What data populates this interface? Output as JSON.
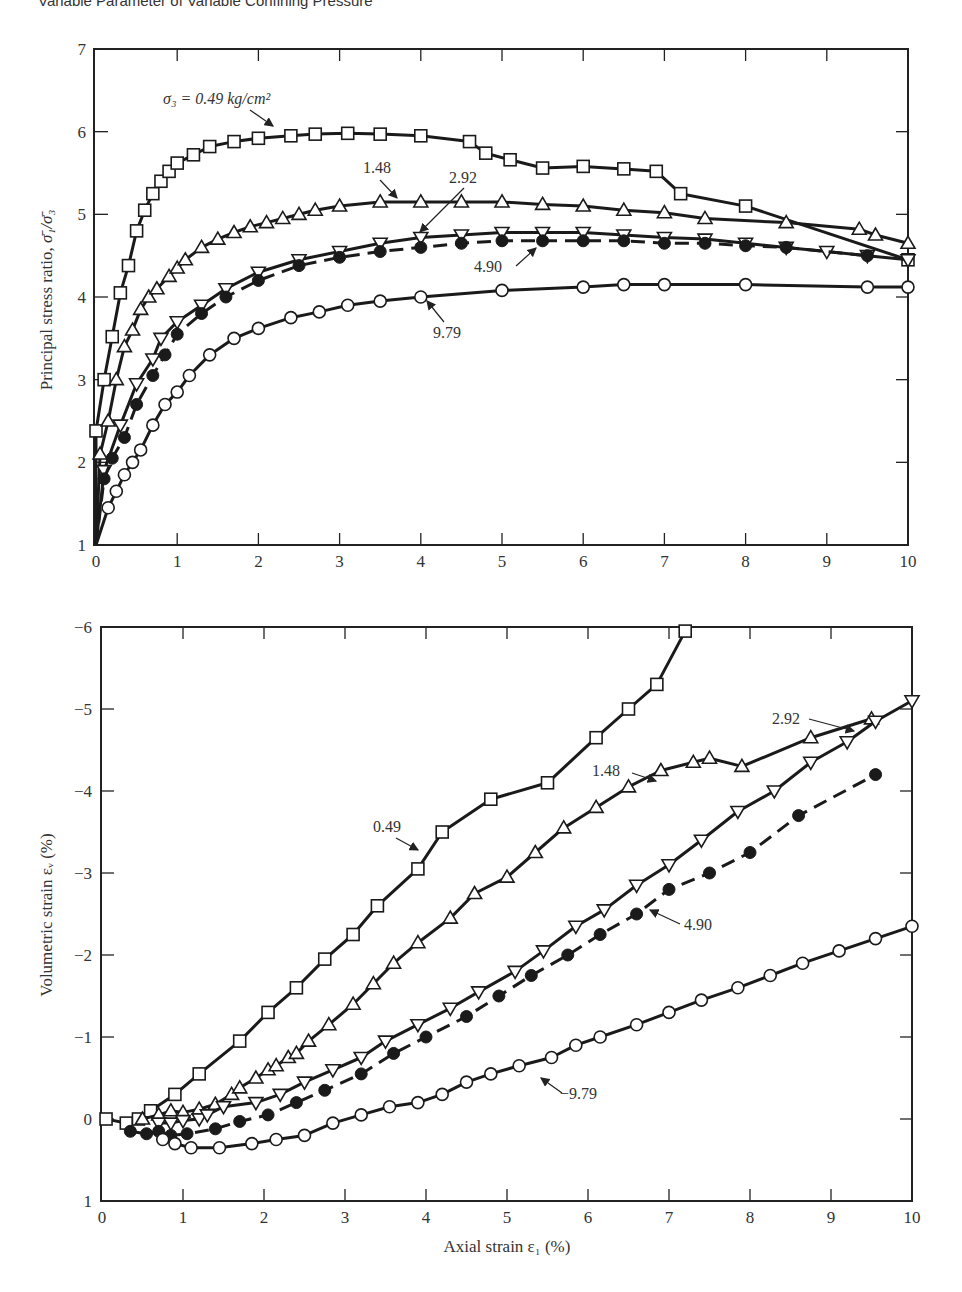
{
  "page": {
    "heading": "Variable Parameter of Variable Confining Pressure"
  },
  "chart_data": [
    {
      "id": "top",
      "type": "line",
      "title": "",
      "xlabel": "",
      "ylabel": "Principal stress ratio, σ̄1/σ̄3",
      "xlim": [
        0,
        10
      ],
      "ylim": [
        1,
        7
      ],
      "xticks": [
        "0",
        "1",
        "2",
        "3",
        "4",
        "5",
        "6",
        "7",
        "8",
        "9",
        "10"
      ],
      "yticks": [
        "1",
        "2",
        "3",
        "4",
        "5",
        "6",
        "7"
      ],
      "grid": false,
      "legend": "none (inline annotations)",
      "annotations": [
        {
          "text": "σ3 = 0.49 kg/cm²",
          "series": "0.49"
        },
        {
          "text": "1.48",
          "series": "1.48"
        },
        {
          "text": "2.92",
          "series": "2.92"
        },
        {
          "text": "4.90",
          "series": "4.90"
        },
        {
          "text": "9.79",
          "series": "9.79"
        }
      ],
      "series": [
        {
          "name": "0.49",
          "marker": "open-square",
          "line": "solid",
          "x": [
            0.0,
            0.1,
            0.2,
            0.3,
            0.4,
            0.5,
            0.6,
            0.7,
            0.8,
            0.9,
            1.0,
            1.2,
            1.4,
            1.7,
            2.0,
            2.4,
            2.7,
            3.1,
            3.5,
            4.0,
            4.6,
            4.8,
            5.1,
            5.5,
            6.0,
            6.5,
            6.9,
            7.2,
            8.0,
            10.0
          ],
          "y": [
            2.38,
            3.0,
            3.52,
            4.05,
            4.38,
            4.8,
            5.05,
            5.25,
            5.4,
            5.52,
            5.62,
            5.72,
            5.82,
            5.88,
            5.92,
            5.95,
            5.97,
            5.98,
            5.97,
            5.95,
            5.88,
            5.74,
            5.66,
            5.56,
            5.58,
            5.55,
            5.52,
            5.25,
            5.1,
            4.45
          ]
        },
        {
          "name": "1.48",
          "marker": "open-triangle-up",
          "line": "solid",
          "x": [
            0.05,
            0.15,
            0.25,
            0.35,
            0.45,
            0.55,
            0.65,
            0.75,
            0.9,
            1.0,
            1.1,
            1.3,
            1.5,
            1.7,
            1.9,
            2.1,
            2.3,
            2.5,
            2.7,
            3.0,
            3.5,
            4.0,
            4.5,
            5.0,
            5.5,
            6.0,
            6.5,
            7.0,
            7.5,
            8.5,
            9.4,
            9.6,
            10.0
          ],
          "y": [
            2.1,
            2.5,
            3.0,
            3.4,
            3.6,
            3.85,
            4.0,
            4.1,
            4.25,
            4.35,
            4.45,
            4.6,
            4.7,
            4.78,
            4.85,
            4.9,
            4.95,
            5.0,
            5.05,
            5.1,
            5.15,
            5.15,
            5.15,
            5.15,
            5.12,
            5.1,
            5.05,
            5.02,
            4.95,
            4.9,
            4.82,
            4.75,
            4.65
          ]
        },
        {
          "name": "2.92",
          "marker": "open-triangle-down",
          "line": "solid",
          "x": [
            0.1,
            0.3,
            0.5,
            0.7,
            0.8,
            1.0,
            1.3,
            1.6,
            2.0,
            2.5,
            3.0,
            3.5,
            4.0,
            4.5,
            5.0,
            5.5,
            6.0,
            6.5,
            7.0,
            7.5,
            8.0,
            8.5,
            9.0,
            9.5,
            10.0
          ],
          "y": [
            1.9,
            2.45,
            2.95,
            3.25,
            3.5,
            3.7,
            3.9,
            4.1,
            4.3,
            4.45,
            4.55,
            4.65,
            4.72,
            4.75,
            4.78,
            4.78,
            4.78,
            4.75,
            4.72,
            4.7,
            4.65,
            4.6,
            4.55,
            4.5,
            4.45
          ]
        },
        {
          "name": "4.90",
          "marker": "filled-circle",
          "line": "dashed",
          "x": [
            0.1,
            0.2,
            0.35,
            0.5,
            0.7,
            0.85,
            1.0,
            1.3,
            1.6,
            2.0,
            2.5,
            3.0,
            3.5,
            4.0,
            4.5,
            5.0,
            5.5,
            6.0,
            6.5,
            7.0,
            7.5,
            8.0,
            8.5,
            9.5
          ],
          "y": [
            1.8,
            2.05,
            2.3,
            2.7,
            3.05,
            3.3,
            3.55,
            3.8,
            4.0,
            4.2,
            4.38,
            4.48,
            4.55,
            4.6,
            4.65,
            4.68,
            4.68,
            4.68,
            4.68,
            4.65,
            4.65,
            4.62,
            4.6,
            4.5
          ]
        },
        {
          "name": "9.79",
          "marker": "open-circle",
          "line": "solid",
          "x": [
            0.15,
            0.25,
            0.35,
            0.45,
            0.55,
            0.7,
            0.85,
            1.0,
            1.15,
            1.4,
            1.7,
            2.0,
            2.4,
            2.75,
            3.1,
            3.5,
            4.0,
            5.0,
            6.0,
            6.5,
            7.0,
            8.0,
            9.5,
            10.0
          ],
          "y": [
            1.45,
            1.65,
            1.85,
            2.0,
            2.15,
            2.45,
            2.7,
            2.85,
            3.05,
            3.3,
            3.5,
            3.62,
            3.75,
            3.82,
            3.9,
            3.95,
            4.0,
            4.08,
            4.12,
            4.15,
            4.15,
            4.15,
            4.12,
            4.12
          ]
        }
      ]
    },
    {
      "id": "bottom",
      "type": "line",
      "title": "",
      "xlabel": "Axial strain ε1 (%)",
      "ylabel": "Volumetric strain εv (%)",
      "xlim": [
        0,
        10
      ],
      "ylim": [
        1,
        -6
      ],
      "xticks": [
        "0",
        "1",
        "2",
        "3",
        "4",
        "5",
        "6",
        "7",
        "8",
        "9",
        "10"
      ],
      "yticks": [
        "1",
        "0",
        "−1",
        "−2",
        "−3",
        "−4",
        "−5",
        "−6"
      ],
      "grid": false,
      "legend": "none (inline annotations)",
      "annotations": [
        {
          "text": "0.49",
          "series": "0.49"
        },
        {
          "text": "1.48",
          "series": "1.48"
        },
        {
          "text": "2.92",
          "series": "2.92"
        },
        {
          "text": "4.90",
          "series": "4.90"
        },
        {
          "text": "9.79",
          "series": "9.79"
        }
      ],
      "series": [
        {
          "name": "0.49",
          "marker": "open-square",
          "line": "solid",
          "x": [
            0.05,
            0.3,
            0.45,
            0.6,
            0.9,
            1.2,
            1.7,
            2.05,
            2.4,
            2.75,
            3.1,
            3.4,
            3.9,
            4.2,
            4.8,
            5.5,
            6.1,
            6.5,
            6.85,
            7.2
          ],
          "y": [
            0.0,
            0.05,
            0.0,
            -0.1,
            -0.3,
            -0.55,
            -0.95,
            -1.3,
            -1.6,
            -1.95,
            -2.25,
            -2.6,
            -3.05,
            -3.5,
            -3.9,
            -4.1,
            -4.65,
            -5.0,
            -5.3,
            -5.95
          ]
        },
        {
          "name": "1.48",
          "marker": "open-triangle-up",
          "line": "solid",
          "x": [
            0.5,
            0.7,
            0.85,
            1.0,
            1.2,
            1.4,
            1.6,
            1.7,
            1.9,
            2.05,
            2.15,
            2.3,
            2.4,
            2.55,
            2.8,
            3.1,
            3.35,
            3.6,
            3.9,
            4.3,
            4.6,
            5.0,
            5.35,
            5.7,
            6.1,
            6.5,
            6.9,
            7.3,
            7.5,
            7.9,
            8.75,
            9.5
          ],
          "y": [
            0.0,
            -0.05,
            -0.1,
            -0.08,
            -0.12,
            -0.18,
            -0.3,
            -0.38,
            -0.5,
            -0.6,
            -0.65,
            -0.75,
            -0.8,
            -0.95,
            -1.15,
            -1.4,
            -1.65,
            -1.9,
            -2.15,
            -2.45,
            -2.75,
            -2.95,
            -3.25,
            -3.55,
            -3.8,
            -4.05,
            -4.25,
            -4.35,
            -4.4,
            -4.3,
            -4.65,
            -4.88
          ]
        },
        {
          "name": "2.92",
          "marker": "open-triangle-down",
          "line": "solid",
          "x": [
            0.7,
            0.85,
            1.0,
            1.2,
            1.3,
            1.5,
            1.9,
            2.2,
            2.5,
            2.85,
            3.2,
            3.5,
            3.9,
            4.3,
            4.65,
            5.1,
            5.45,
            5.85,
            6.2,
            6.6,
            7.0,
            7.4,
            7.85,
            8.3,
            8.75,
            9.2,
            9.55,
            10.0
          ],
          "y": [
            0.05,
            0.05,
            0.02,
            0.0,
            -0.05,
            -0.15,
            -0.2,
            -0.3,
            -0.45,
            -0.6,
            -0.75,
            -0.95,
            -1.15,
            -1.35,
            -1.55,
            -1.8,
            -2.05,
            -2.35,
            -2.55,
            -2.85,
            -3.1,
            -3.4,
            -3.75,
            -4.0,
            -4.35,
            -4.6,
            -4.85,
            -5.1
          ]
        },
        {
          "name": "4.90",
          "marker": "filled-circle",
          "line": "dashed",
          "x": [
            0.35,
            0.55,
            0.7,
            0.85,
            1.05,
            1.4,
            1.7,
            2.05,
            2.4,
            2.75,
            3.2,
            3.6,
            4.0,
            4.5,
            4.9,
            5.3,
            5.75,
            6.15,
            6.6,
            7.0,
            7.5,
            8.0,
            8.6,
            9.55
          ],
          "y": [
            0.15,
            0.18,
            0.15,
            0.2,
            0.18,
            0.12,
            0.03,
            -0.05,
            -0.2,
            -0.35,
            -0.55,
            -0.8,
            -1.0,
            -1.25,
            -1.5,
            -1.75,
            -2.0,
            -2.25,
            -2.5,
            -2.8,
            -3.0,
            -3.25,
            -3.7,
            -4.2
          ]
        },
        {
          "name": "9.79",
          "marker": "open-circle",
          "line": "solid",
          "x": [
            0.75,
            0.9,
            1.1,
            1.45,
            1.85,
            2.15,
            2.5,
            2.85,
            3.2,
            3.55,
            3.9,
            4.2,
            4.5,
            4.8,
            5.15,
            5.55,
            5.85,
            6.15,
            6.6,
            7.0,
            7.4,
            7.85,
            8.25,
            8.65,
            9.1,
            9.55,
            10.0
          ],
          "y": [
            0.25,
            0.3,
            0.35,
            0.35,
            0.3,
            0.25,
            0.2,
            0.05,
            -0.05,
            -0.15,
            -0.2,
            -0.3,
            -0.45,
            -0.55,
            -0.65,
            -0.75,
            -0.9,
            -1.0,
            -1.15,
            -1.3,
            -1.45,
            -1.6,
            -1.75,
            -1.9,
            -2.05,
            -2.2,
            -2.35
          ]
        }
      ]
    }
  ],
  "labels": {
    "top_ylabel_main": "Principal stress ratio, ",
    "top_ylabel_math": "σ̄₁/σ̄₃",
    "bottom_ylabel": "Volumetric strain εᵥ (%)",
    "bottom_xlabel": "Axial strain ε₁ (%)",
    "top_annot_049": "σ₃ = 0.49 kg/cm²",
    "top_annot_148": "1.48",
    "top_annot_292": "2.92",
    "top_annot_490": "4.90",
    "top_annot_979": "9.79",
    "bot_annot_049": "0.49",
    "bot_annot_148": "1.48",
    "bot_annot_292": "2.92",
    "bot_annot_490": "4.90",
    "bot_annot_979": "−9.79"
  }
}
